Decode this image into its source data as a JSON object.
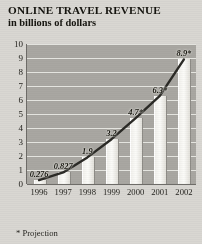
{
  "title": "ONLINE TRAVEL REVENUE",
  "subtitle": "in billions of dollars",
  "footnote": "* Projection",
  "colors": {
    "plot_background": "#a9a7a2",
    "gridline": "#efeeea",
    "bar_fill": "#f7f6f2",
    "trend_line": "#2b2a26",
    "text": "#1b1a18",
    "page_background": "#d9d7d2"
  },
  "chart_data": {
    "type": "bar",
    "title": "ONLINE TRAVEL REVENUE",
    "subtitle": "in billions of dollars",
    "xlabel": "",
    "ylabel": "in billions of dollars",
    "ylim": [
      0,
      10
    ],
    "yticks": [
      0,
      1,
      2,
      3,
      4,
      5,
      6,
      7,
      8,
      9,
      10
    ],
    "ytick_labels": [
      "0",
      "1",
      "2",
      "3",
      "4",
      "5",
      "6",
      "7",
      "8",
      "9",
      "10"
    ],
    "grid": true,
    "legend": "none",
    "categories": [
      "1996",
      "1997",
      "1998",
      "1999",
      "2000",
      "2001",
      "2002"
    ],
    "values": [
      0.276,
      0.827,
      1.9,
      3.2,
      4.7,
      6.3,
      8.9
    ],
    "point_labels": [
      "0.276",
      "0.827",
      "1.9",
      "3.2",
      "4.7*",
      "6.3*",
      "8.9*"
    ],
    "projected": [
      false,
      false,
      false,
      false,
      true,
      true,
      true
    ],
    "overlay_series": {
      "name": "trend",
      "type": "line",
      "values": [
        0.276,
        0.827,
        1.9,
        3.2,
        4.7,
        6.3,
        8.9
      ]
    },
    "annotations": [
      "* Projection"
    ]
  }
}
